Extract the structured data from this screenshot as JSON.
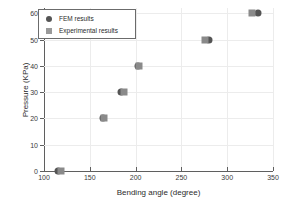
{
  "chart_data": {
    "type": "scatter",
    "title": "",
    "xlabel": "Bending angle (degree)",
    "ylabel": "Pressure (KPa)",
    "xlim": [
      100,
      350
    ],
    "ylim": [
      0,
      62
    ],
    "xticks": [
      100,
      150,
      200,
      250,
      300,
      350
    ],
    "yticks": [
      0,
      10,
      20,
      30,
      40,
      50,
      60
    ],
    "grid": true,
    "legend_position": "upper-left",
    "series": [
      {
        "name": "FEM results",
        "marker": "circle",
        "color": "#545454",
        "points": [
          {
            "x": 115,
            "y": 0
          },
          {
            "x": 164,
            "y": 20
          },
          {
            "x": 184,
            "y": 30
          },
          {
            "x": 203,
            "y": 40
          },
          {
            "x": 280,
            "y": 50
          },
          {
            "x": 334,
            "y": 60
          }
        ]
      },
      {
        "name": "Experimental results",
        "marker": "square",
        "color": "#8a8a8a",
        "points": [
          {
            "x": 119,
            "y": 0
          },
          {
            "x": 166,
            "y": 20
          },
          {
            "x": 187,
            "y": 30
          },
          {
            "x": 204,
            "y": 40
          },
          {
            "x": 276,
            "y": 50
          },
          {
            "x": 327,
            "y": 60
          }
        ]
      }
    ]
  },
  "legend": {
    "items": [
      {
        "label": "FEM results",
        "marker": "circle"
      },
      {
        "label": "Experimental results",
        "marker": "square"
      }
    ]
  }
}
